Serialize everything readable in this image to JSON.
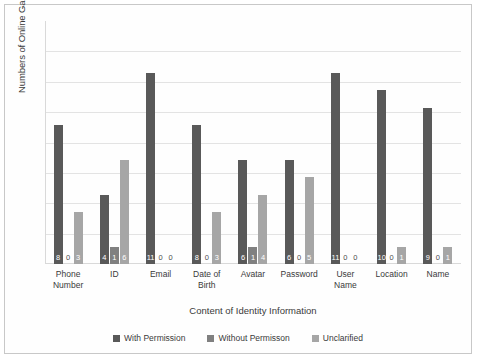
{
  "chart_data": {
    "type": "bar",
    "title": "",
    "xlabel": "Content of Identity Information",
    "ylabel": "Numbers of  Online Game Platforms",
    "categories": [
      "Phone Number",
      "ID",
      "Email",
      "Date of Birth",
      "Avatar",
      "Password",
      "User Name",
      "Location",
      "Name"
    ],
    "series": [
      {
        "name": "With Permission",
        "color": "#595959",
        "values": [
          8,
          4,
          11,
          8,
          6,
          6,
          11,
          10,
          9
        ]
      },
      {
        "name": "Without Permisson",
        "color": "#808080",
        "values": [
          0,
          1,
          0,
          0,
          1,
          0,
          0,
          0,
          0
        ]
      },
      {
        "name": "Unclarified",
        "color": "#a6a6a6",
        "values": [
          3,
          6,
          0,
          3,
          4,
          5,
          0,
          1,
          1
        ]
      }
    ],
    "ylim": [
      0,
      14
    ],
    "ytick_labels": [],
    "grid": true,
    "legend_position": "bottom",
    "gridline_count": 7
  },
  "legend": {
    "items": [
      {
        "label": "With Permission",
        "color": "#595959"
      },
      {
        "label": "Without Permisson",
        "color": "#808080"
      },
      {
        "label": "Unclarified",
        "color": "#a6a6a6"
      }
    ]
  },
  "axis": {
    "x_title": "Content of Identity Information",
    "y_title": "Numbers of  Online Game Platforms"
  },
  "tick_lines": [
    [
      "Phone",
      "Number"
    ],
    [
      "ID",
      ""
    ],
    [
      "Email",
      ""
    ],
    [
      "Date of",
      "Birth"
    ],
    [
      "Avatar",
      ""
    ],
    [
      "Password",
      ""
    ],
    [
      "User",
      "Name"
    ],
    [
      "Location",
      ""
    ],
    [
      "Name",
      ""
    ]
  ]
}
